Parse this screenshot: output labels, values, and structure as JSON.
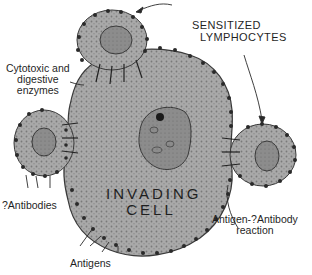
{
  "diagram": {
    "colors": {
      "cytoplasm": "#a9a9a9",
      "nucleus": "#8c8c8c",
      "outline": "#3a3a3a",
      "surface_dots": "#2a2a2a",
      "ink": "#1f1f1f",
      "background": "#ffffff"
    },
    "cells": {
      "invading_cell": {
        "label_line1": "INVADING",
        "label_line2": "CELL"
      },
      "lymphocytes": [
        "top-lymphocyte",
        "left-lymphocyte",
        "right-lymphocyte"
      ]
    },
    "labels": {
      "sensitized_line1": "SENSITIZED",
      "sensitized_line2": "LYMPHOCYTES",
      "cytotoxic_line1": "Cytotoxic and",
      "cytotoxic_line2": "digestive",
      "cytotoxic_line3": "enzymes",
      "antibodies": "?Antibodies",
      "antigens": "Antigens",
      "reaction_line1": "Antigen-?Antibody",
      "reaction_line2": "reaction"
    }
  }
}
